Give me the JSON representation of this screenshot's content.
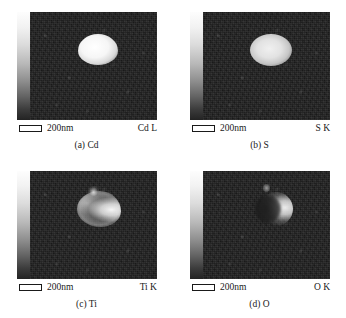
{
  "figure": {
    "panels": [
      {
        "id": "a",
        "caption": "(a) Cd",
        "element_label": "Cd L",
        "scale_text": "200nm",
        "element": "Cd",
        "line": "L",
        "signal_shape": "solid-ellipse",
        "signal_description": "bright filled elliptical particle, uniform high intensity core"
      },
      {
        "id": "b",
        "caption": "(b) S",
        "element_label": "S K",
        "scale_text": "200nm",
        "element": "S",
        "line": "K",
        "signal_shape": "solid-ellipse",
        "signal_description": "bright filled elliptical particle, slightly mottled texture"
      },
      {
        "id": "c",
        "caption": "(c) Ti",
        "element_label": "Ti K",
        "scale_text": "200nm",
        "element": "Ti",
        "line": "K",
        "signal_shape": "hollow-shell",
        "signal_description": "irregular ring/shell with darker interior and bright right crescent"
      },
      {
        "id": "d",
        "caption": "(d) O",
        "element_label": "O K",
        "scale_text": "200nm",
        "element": "O",
        "line": "K",
        "signal_shape": "crescent",
        "signal_description": "bright crescent concentrated on right side of particle"
      }
    ],
    "colorbar": {
      "name": "intensity-colorbar",
      "orientation": "vertical",
      "top": "high",
      "bottom": "low",
      "top_color": "#fdfdfd",
      "bottom_color": "#232323"
    },
    "background_color": "#1d1d1d",
    "page_background": "#ffffff"
  }
}
